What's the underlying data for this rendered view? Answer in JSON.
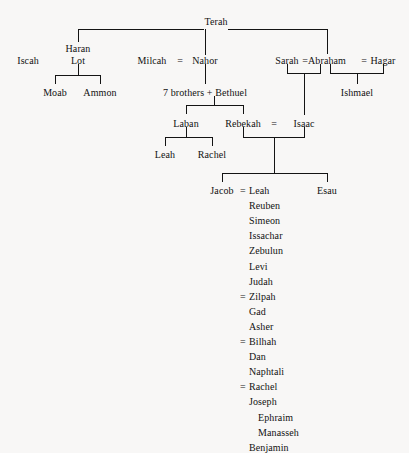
{
  "diagram": {
    "type": "family-tree",
    "background_color": "#f8f7f6",
    "text_color": "#121212",
    "line_color": "#141414",
    "nodes": {
      "terah": "Terah",
      "haran": "Haran",
      "iscah": "Iscah",
      "lot": "Lot",
      "moab": "Moab",
      "ammon": "Ammon",
      "milcah": "Milcah",
      "eq_milcah_nahor": "=",
      "nahor": "Nahor",
      "seven_brothers_bethuel": "7 brothers + Bethuel",
      "sarah": "Sarah",
      "eq_sarah_abraham": "=",
      "abraham": "Abraham",
      "eq_abraham_hagar": "=",
      "hagar": "Hagar",
      "ishmael": "Ishmael",
      "laban": "Laban",
      "rebekah": "Rebekah",
      "eq_rebekah_isaac": "=",
      "isaac": "Isaac",
      "leah_daughter": "Leah",
      "rachel_daughter": "Rachel",
      "jacob": "Jacob",
      "eq_jacob_leah": "=",
      "leah_wife": "Leah",
      "esau": "Esau"
    },
    "jacob_families": [
      {
        "marriage_symbol": "",
        "wife": "Leah",
        "children": [
          {
            "name": "Reuben",
            "indent": 0
          },
          {
            "name": "Simeon",
            "indent": 0
          },
          {
            "name": "Issachar",
            "indent": 0
          },
          {
            "name": "Zebulun",
            "indent": 0
          },
          {
            "name": "Levi",
            "indent": 0
          },
          {
            "name": "Judah",
            "indent": 0
          }
        ]
      },
      {
        "marriage_symbol": "=",
        "wife": "Zilpah",
        "children": [
          {
            "name": "Gad",
            "indent": 0
          },
          {
            "name": "Asher",
            "indent": 0
          }
        ]
      },
      {
        "marriage_symbol": "=",
        "wife": "Bilhah",
        "children": [
          {
            "name": "Dan",
            "indent": 0
          },
          {
            "name": "Naphtali",
            "indent": 0
          }
        ]
      },
      {
        "marriage_symbol": "=",
        "wife": "Rachel",
        "children": [
          {
            "name": "Joseph",
            "indent": 0
          },
          {
            "name": "Ephraim",
            "indent": 1
          },
          {
            "name": "Manasseh",
            "indent": 1
          },
          {
            "name": "Benjamin",
            "indent": 0
          }
        ]
      }
    ]
  }
}
